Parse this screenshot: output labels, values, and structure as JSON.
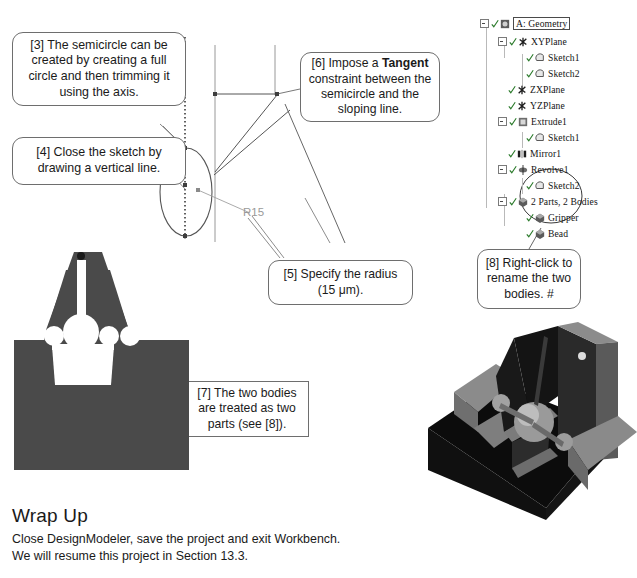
{
  "callouts": [
    {
      "id": "3",
      "text": "[3] The semicircle can be created by creating a full circle and then trimming it using the axis."
    },
    {
      "id": "4",
      "text": "[4] Close the sketch by drawing a vertical line."
    },
    {
      "id": "6",
      "pre": "[6] Impose a ",
      "bold": "Tangent",
      "post": " constraint between the semicircle and the sloping line."
    },
    {
      "id": "5",
      "text": "[5] Specify the radius (15 μm)."
    },
    {
      "id": "7",
      "text": "[7] The two bodies are treated as two parts (see [8])."
    },
    {
      "id": "8",
      "text": "[8] Right-click to rename the two bodies. #"
    }
  ],
  "sketch": {
    "radius_label": "R15"
  },
  "tree": {
    "title": "A: Geometry",
    "items": [
      {
        "label": "A: Geometry",
        "icon": "geometry-icon",
        "depth": 0,
        "expander": true,
        "check": true,
        "boxed": true
      },
      {
        "label": "XYPlane",
        "icon": "plane-icon",
        "depth": 1,
        "expander": true,
        "check": true
      },
      {
        "label": "Sketch1",
        "icon": "sketch-icon",
        "depth": 2,
        "expander": false,
        "check": true
      },
      {
        "label": "Sketch2",
        "icon": "sketch-icon",
        "depth": 2,
        "expander": false,
        "check": true
      },
      {
        "label": "ZXPlane",
        "icon": "plane-icon",
        "depth": 1,
        "expander": false,
        "check": true
      },
      {
        "label": "YZPlane",
        "icon": "plane-icon",
        "depth": 1,
        "expander": false,
        "check": true
      },
      {
        "label": "Extrude1",
        "icon": "extrude-icon",
        "depth": 1,
        "expander": true,
        "check": true
      },
      {
        "label": "Sketch1",
        "icon": "sketch-icon",
        "depth": 2,
        "expander": false,
        "check": true
      },
      {
        "label": "Mirror1",
        "icon": "mirror-icon",
        "depth": 1,
        "expander": false,
        "check": true
      },
      {
        "label": "Revolve1",
        "icon": "revolve-icon",
        "depth": 1,
        "expander": true,
        "check": true
      },
      {
        "label": "Sketch2",
        "icon": "sketch-icon",
        "depth": 2,
        "expander": false,
        "check": true
      },
      {
        "label": "2 Parts, 2 Bodies",
        "icon": "bodies-icon",
        "depth": 1,
        "expander": true,
        "check": true
      },
      {
        "label": "Gripper",
        "icon": "body-icon",
        "depth": 2,
        "expander": false,
        "check": true
      },
      {
        "label": "Bead",
        "icon": "body-icon",
        "depth": 2,
        "expander": false,
        "check": true
      }
    ]
  },
  "wrap_up": {
    "heading": "Wrap Up",
    "line1": "Close DesignModeler, save the project and exit Workbench.",
    "line2": "We will resume this project in Section 13.3."
  },
  "colors": {
    "profile_gray": "#4a4a4a",
    "model_dark": "#0c0c0c",
    "model_mid": "#6f6f6f",
    "model_light": "#a8a8a8",
    "callout_border": "#6e6e6e",
    "sketch_line": "#555555",
    "dim_text": "#9a9a9a"
  }
}
